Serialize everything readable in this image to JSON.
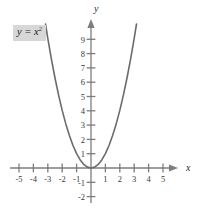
{
  "figure": {
    "name": "parabola-graph",
    "equation_label": {
      "base": "y = x",
      "exponent": "2",
      "full": "y = x²",
      "background_color": "#d7d7d7"
    },
    "axis_names": {
      "x": "x",
      "y": "y"
    },
    "colors": {
      "curve": "#6b6b6b",
      "axis": "#7d7d7d",
      "text": "#2e2e2e",
      "background": "#ffffff"
    }
  },
  "chart_data": {
    "type": "line",
    "title": "",
    "subtitle": "",
    "xlabel": "x",
    "ylabel": "y",
    "xlim": [
      -5.6,
      5.8
    ],
    "ylim": [
      -2.6,
      10.2
    ],
    "grid": false,
    "legend": null,
    "annotations": [
      {
        "text": "y = x²",
        "x": -4.4,
        "y": 9.4
      }
    ],
    "xticks": [
      -5,
      -4,
      -3,
      -2,
      -1,
      1,
      2,
      3,
      4,
      5
    ],
    "xtick_labels": [
      "-5",
      "-4",
      "-3",
      "-2",
      "-1",
      "1",
      "2",
      "3",
      "4",
      "5"
    ],
    "yticks": [
      -2,
      -1,
      1,
      2,
      3,
      4,
      5,
      6,
      7,
      8,
      9
    ],
    "ytick_labels": [
      "-2",
      "-1",
      "1",
      "2",
      "3",
      "4",
      "5",
      "6",
      "7",
      "8",
      "9"
    ],
    "series": [
      {
        "name": "y = x²",
        "equation": "y = x^2",
        "x": [
          -3.16,
          -3.0,
          -2.75,
          -2.5,
          -2.25,
          -2.0,
          -1.75,
          -1.5,
          -1.25,
          -1.0,
          -0.75,
          -0.5,
          -0.25,
          0,
          0.25,
          0.5,
          0.75,
          1.0,
          1.25,
          1.5,
          1.75,
          2.0,
          2.25,
          2.5,
          2.75,
          3.0,
          3.16
        ],
        "values": [
          10.0,
          9.0,
          7.5625,
          6.25,
          5.0625,
          4.0,
          3.0625,
          2.25,
          1.5625,
          1.0,
          0.5625,
          0.25,
          0.0625,
          0,
          0.0625,
          0.25,
          0.5625,
          1.0,
          1.5625,
          2.25,
          3.0625,
          4.0,
          5.0625,
          6.25,
          7.5625,
          9.0,
          10.0
        ]
      }
    ]
  }
}
